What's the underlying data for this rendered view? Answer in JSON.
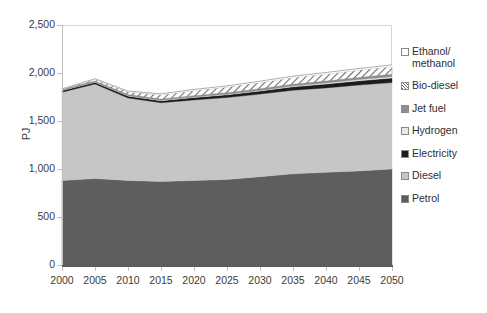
{
  "chart_data": {
    "type": "area",
    "stacked": true,
    "title": "",
    "xlabel": "",
    "ylabel": "PJ",
    "ylim": [
      0,
      2500
    ],
    "yticks": [
      "0",
      "500",
      "1,000",
      "1,500",
      "2,000",
      "2,500"
    ],
    "ytick_values": [
      0,
      500,
      1000,
      1500,
      2000,
      2500
    ],
    "grid": false,
    "legend_position": "right",
    "x": [
      2000,
      2005,
      2010,
      2015,
      2020,
      2025,
      2030,
      2035,
      2040,
      2045,
      2050
    ],
    "categories": [
      "2000",
      "2005",
      "2010",
      "2015",
      "2020",
      "2025",
      "2030",
      "2035",
      "2040",
      "2045",
      "2050"
    ],
    "series": [
      {
        "name": "Petrol",
        "color": "#5e5e5e",
        "values": [
          880,
          900,
          880,
          870,
          880,
          890,
          920,
          950,
          965,
          980,
          1000
        ]
      },
      {
        "name": "Diesel",
        "color": "#c6c6c6",
        "values": [
          920,
          985,
          860,
          820,
          840,
          855,
          860,
          870,
          880,
          895,
          900
        ]
      },
      {
        "name": "Electricity",
        "color": "#1c1c1c",
        "values": [
          18,
          19,
          20,
          22,
          25,
          28,
          32,
          36,
          40,
          44,
          48
        ]
      },
      {
        "name": "Hydrogen",
        "color": "#e8e8e8",
        "values": [
          2,
          2,
          3,
          3,
          4,
          5,
          6,
          8,
          10,
          12,
          14
        ]
      },
      {
        "name": "Jet fuel",
        "color": "#8e8e8e",
        "values": [
          10,
          11,
          12,
          13,
          15,
          16,
          18,
          19,
          21,
          22,
          24
        ]
      },
      {
        "name": "Bio-diesel",
        "color": "#6e6e6e",
        "pattern": "diagonal-hatch",
        "values": [
          2,
          18,
          30,
          46,
          54,
          60,
          66,
          70,
          74,
          78,
          82
        ]
      },
      {
        "name": "Ethanol/\nmethanol",
        "color": "#ffffff",
        "values": [
          3,
          5,
          7,
          9,
          11,
          12,
          13,
          14,
          15,
          16,
          17
        ]
      }
    ],
    "totals": [
      1835,
      1940,
      1812,
      1783,
      1829,
      1866,
      1915,
      1967,
      2005,
      2047,
      2085
    ]
  },
  "legend": {
    "items": [
      {
        "label": "Ethanol/\nmethanol",
        "swatch": "sw-ethanol",
        "name": "ethanol-methanol"
      },
      {
        "label": "Bio-diesel",
        "swatch": "sw-biodiesel",
        "name": "bio-diesel"
      },
      {
        "label": "Jet fuel",
        "swatch": "sw-jetfuel",
        "name": "jet-fuel"
      },
      {
        "label": "Hydrogen",
        "swatch": "sw-hydrogen",
        "name": "hydrogen"
      },
      {
        "label": "Electricity",
        "swatch": "sw-electricity",
        "name": "electricity"
      },
      {
        "label": "Diesel",
        "swatch": "sw-diesel",
        "name": "diesel"
      },
      {
        "label": "Petrol",
        "swatch": "sw-petrol",
        "name": "petrol"
      }
    ]
  },
  "axes": {
    "y_title": "PJ",
    "y_labels": [
      "2,500",
      "2,000",
      "1,500",
      "1,000",
      "500",
      "0"
    ],
    "x_labels": [
      "2000",
      "2005",
      "2010",
      "2015",
      "2020",
      "2025",
      "2030",
      "2035",
      "2040",
      "2045",
      "2050"
    ]
  }
}
